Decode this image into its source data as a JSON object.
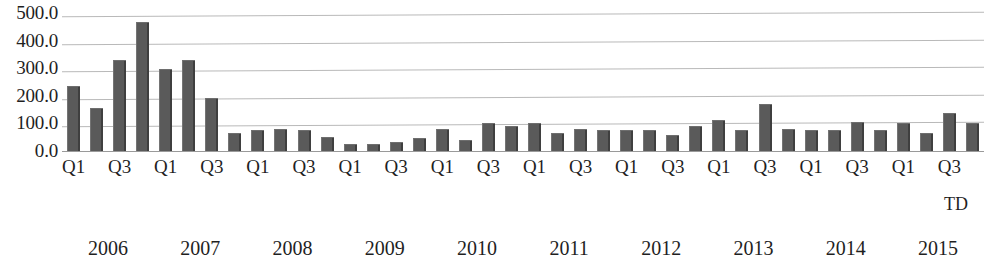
{
  "chart_data": {
    "type": "bar",
    "title": "",
    "subtitle": "",
    "xlabel": "TD",
    "ylabel": "",
    "ylim": [
      0,
      500
    ],
    "ytick_labels": [
      "500.0",
      "400.0",
      "300.0",
      "200.0",
      "100.0",
      "0.0"
    ],
    "ytick_values": [
      500,
      400,
      300,
      200,
      100,
      0
    ],
    "grid": true,
    "legend": "none",
    "bar_color": "#5a5a5a",
    "gridline_color": "#b9b9b9",
    "axis_color": "#9a9a9a",
    "categories": [
      "2006 Q1",
      "2006 Q2",
      "2006 Q3",
      "2006 Q4",
      "2007 Q1",
      "2007 Q2",
      "2007 Q3",
      "2007 Q4",
      "2008 Q1",
      "2008 Q2",
      "2008 Q3",
      "2008 Q4",
      "2009 Q1",
      "2009 Q2",
      "2009 Q3",
      "2009 Q4",
      "2010 Q1",
      "2010 Q2",
      "2010 Q3",
      "2010 Q4",
      "2011 Q1",
      "2011 Q2",
      "2011 Q3",
      "2011 Q4",
      "2012 Q1",
      "2012 Q2",
      "2012 Q3",
      "2012 Q4",
      "2013 Q1",
      "2013 Q2",
      "2013 Q3",
      "2013 Q4",
      "2014 Q1",
      "2014 Q2",
      "2014 Q3",
      "2014 Q4",
      "2015 Q1",
      "2015 Q2",
      "2015 Q3",
      "2015 Q4"
    ],
    "values": [
      240,
      160,
      335,
      470,
      300,
      335,
      195,
      70,
      80,
      85,
      80,
      55,
      30,
      30,
      35,
      50,
      85,
      45,
      105,
      95,
      105,
      70,
      85,
      80,
      80,
      80,
      60,
      95,
      115,
      80,
      175,
      85,
      80,
      80,
      110,
      80,
      105,
      70,
      140,
      105
    ],
    "quarter_tick_labels": [
      "Q1",
      "Q3",
      "Q1",
      "Q3",
      "Q1",
      "Q3",
      "Q1",
      "Q3",
      "Q1",
      "Q3",
      "Q1",
      "Q3",
      "Q1",
      "Q3",
      "Q1",
      "Q3",
      "Q1",
      "Q3",
      "Q1",
      "Q3"
    ],
    "year_labels": [
      "2006",
      "2007",
      "2008",
      "2009",
      "2010",
      "2011",
      "2012",
      "2013",
      "2014",
      "2015"
    ]
  }
}
